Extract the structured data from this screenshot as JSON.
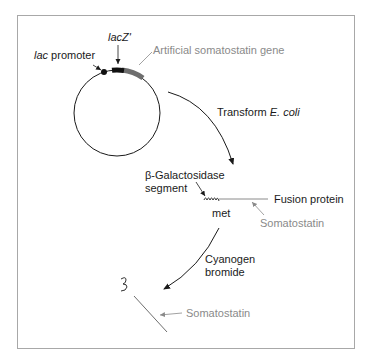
{
  "figure": {
    "labels": {
      "lacz": "lacZ'",
      "lac_italic": "lac",
      "promoter": " promoter",
      "artificial_gene": "Artificial somatostatin gene",
      "transform": "Transform ",
      "ecoli": "E. coli",
      "bgal_line1": "β-Galactosidase",
      "bgal_line2": "segment",
      "fusion_protein": "Fusion protein",
      "met": "met",
      "somatostatin_1": "Somatostatin",
      "cyanogen_line1": "Cyanogen",
      "cyanogen_line2": "bromide",
      "somatostatin_2": "Somatostatin"
    },
    "colors": {
      "ink": "#1a1a1a",
      "gene_gray": "#6e6e6e",
      "label_gray": "#8a8a8a",
      "frame": "#a8a8a8"
    }
  }
}
